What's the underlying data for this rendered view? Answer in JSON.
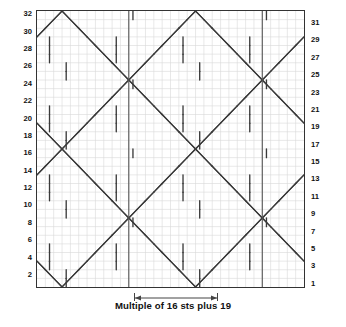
{
  "chart_data": {
    "type": "table",
    "title": "",
    "caption": "Multiple of 16 sts plus 19",
    "rows": 32,
    "columns": 32,
    "row_numbers_left": [
      32,
      30,
      28,
      26,
      24,
      22,
      20,
      18,
      16,
      14,
      12,
      10,
      8,
      6,
      4,
      2
    ],
    "row_numbers_right": [
      31,
      29,
      27,
      25,
      23,
      21,
      19,
      17,
      15,
      13,
      11,
      9,
      7,
      5,
      3,
      1
    ],
    "xlabel": "",
    "ylabel": "",
    "grid": true,
    "legend": "",
    "repeat": {
      "label": "Multiple of 16 sts plus 19",
      "stitch_multiple": 16,
      "plus_stitches": 19,
      "boundary_columns": [
        11,
        27
      ]
    },
    "grid_color": "#d9d9d9",
    "symbol_color": "#3a3a3a",
    "border_color": "#333333",
    "symbols": {
      "right_cross": "/",
      "left_cross": "\\",
      "vertical": "|",
      "travel_pair": "Y"
    },
    "note": "Cable lattice / trellis chart: diagonal travelling-stitch lines crossing over a plain ground, forming a diamond lattice repeat."
  },
  "axes": {
    "left_label_name": "row-number-even",
    "right_label_name": "row-number-odd"
  },
  "caption": {
    "text": "Multiple of 16 sts plus 19"
  },
  "colors": {
    "grid": "#d9d9d9",
    "symbol": "#3a3a3a",
    "border": "#333333",
    "repeat_line": "#555555",
    "background": "#ffffff"
  }
}
